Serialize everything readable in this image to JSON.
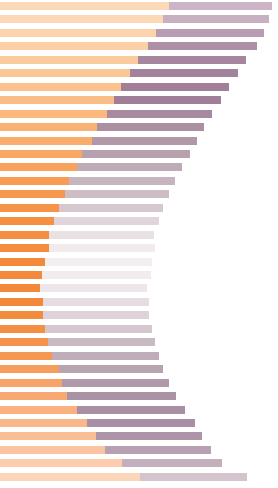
{
  "chart_data": {
    "type": "bar",
    "orientation": "horizontal",
    "stacked": true,
    "title": "",
    "subtitle": "",
    "xlabel": "",
    "ylabel": "",
    "grid": false,
    "legend": null,
    "xlim": [
      0,
      278
    ],
    "categories": [
      "1",
      "2",
      "3",
      "4",
      "5",
      "6",
      "7",
      "8",
      "9",
      "10",
      "11",
      "12",
      "13",
      "14",
      "15",
      "16",
      "17",
      "18",
      "19",
      "20",
      "21",
      "22",
      "23",
      "24",
      "25",
      "26",
      "27",
      "28",
      "29",
      "30",
      "31",
      "32",
      "33",
      "34",
      "35",
      "36"
    ],
    "series": [
      {
        "name": "series-a",
        "color_range": [
          "#fbd9b9",
          "#f58e3f"
        ],
        "values": [
          169,
          163,
          156,
          148,
          138,
          130,
          121,
          114,
          107,
          97,
          92,
          82,
          77,
          69,
          65,
          59,
          54,
          49,
          49,
          45,
          42,
          40,
          43,
          43,
          45,
          48,
          52,
          59,
          62,
          67,
          77,
          87,
          96,
          105,
          122,
          140
        ]
      },
      {
        "name": "series-b",
        "color_range": [
          "#cbb5c6",
          "#f2eaf0"
        ],
        "values": [
          103,
          106,
          108,
          109,
          108,
          108,
          108,
          107,
          105,
          107,
          105,
          108,
          105,
          106,
          104,
          104,
          105,
          105,
          106,
          107,
          109,
          107,
          106,
          106,
          107,
          107,
          107,
          104,
          107,
          109,
          108,
          108,
          106,
          106,
          100,
          107
        ]
      }
    ],
    "row_colors_a": [
      "#fbd9b9",
      "#fbd8b7",
      "#fbd4ad",
      "#fbd0a6",
      "#fbcb9d",
      "#fbc796",
      "#fbc28d",
      "#fabd85",
      "#fab87d",
      "#f9b273",
      "#f9ad6b",
      "#f9a763",
      "#f8a25c",
      "#f79c54",
      "#f6974e",
      "#f59348",
      "#f59043",
      "#f48d3f",
      "#f48c3d",
      "#f38a3b",
      "#f38939",
      "#f28838",
      "#f2893a",
      "#f38b3d",
      "#f48e43",
      "#f4934b",
      "#f59854",
      "#f69e5f",
      "#f7a369",
      "#f8a973",
      "#f9b27f",
      "#fab88a",
      "#fabe95",
      "#fbc4a0",
      "#fbcdae",
      "#fbd6b9"
    ],
    "row_colors_b": [
      "#cbb5c6",
      "#c7b0c2",
      "#b79cb3",
      "#ad8fa8",
      "#a6869f",
      "#a3829c",
      "#a17f99",
      "#a07e98",
      "#a88aa0",
      "#ab8fa3",
      "#b098a8",
      "#b7a1af",
      "#bfabb7",
      "#c6b4be",
      "#cdbdc5",
      "#d6c8ce",
      "#e1d5db",
      "#eae1e5",
      "#f1ebee",
      "#f3eef0",
      "#f2ecef",
      "#ece5e9",
      "#e6dde2",
      "#ded3da",
      "#d4c7cf",
      "#c8b9c3",
      "#bfaeba",
      "#b6a4b1",
      "#b099ab",
      "#ab93a6",
      "#a88fa3",
      "#a98fa4",
      "#ad94a8",
      "#b7a0b1",
      "#c4b0bd",
      "#d4c4cd"
    ],
    "row_geometry": {
      "bar_height": 8,
      "row_pitch": 13.45,
      "top_offset": 2
    }
  }
}
